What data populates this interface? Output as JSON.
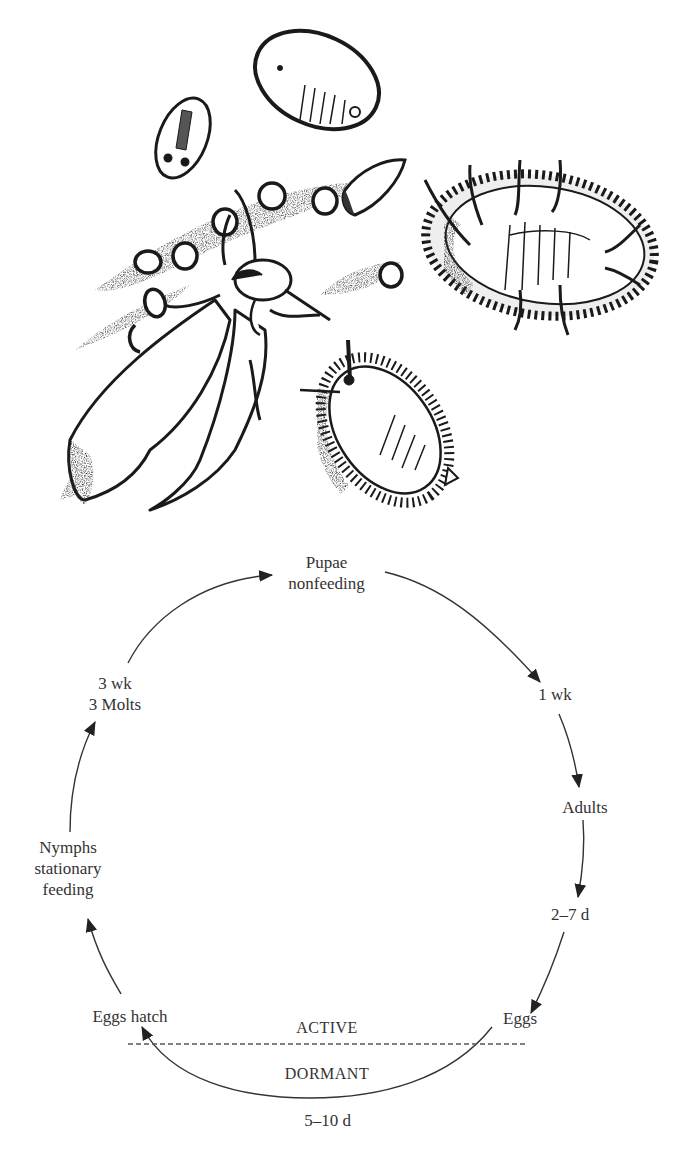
{
  "figure": {
    "illustration": {
      "subjects": [
        "adult whitefly (winged)",
        "eggs (chain on leaf)",
        "first instar nymph",
        "nymph",
        "pupa with waxy filaments",
        "pupa / red-eye stage"
      ]
    },
    "cycle": {
      "stages": {
        "pupae": {
          "line1": "Pupae",
          "line2": "nonfeeding"
        },
        "pupa_to_adult": {
          "line1": "1 wk"
        },
        "adults": {
          "line1": "Adults"
        },
        "adult_to_eggs": {
          "line1": "2–7 d"
        },
        "eggs": {
          "line1": "Eggs"
        },
        "eggs_hatch": {
          "line1": "Eggs hatch"
        },
        "nymphs": {
          "line1": "Nymphs",
          "line2": "stationary",
          "line3": "feeding"
        },
        "nymph_duration": {
          "line1": "3 wk",
          "line2": "3 Molts"
        }
      },
      "zones": {
        "active": "ACTIVE",
        "dormant": "DORMANT"
      },
      "dormant_duration": "5–10 d"
    },
    "colors": {
      "ink": "#222222",
      "text": "#333333",
      "background": "#ffffff"
    }
  }
}
